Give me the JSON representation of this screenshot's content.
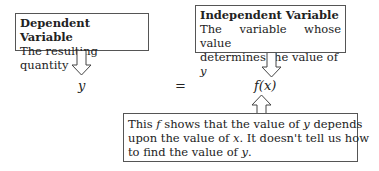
{
  "dependent": {
    "title": "Dependent Variable",
    "desc": "The resulting quantity"
  },
  "independent": {
    "title": "Independent Variable",
    "desc_1": "The variable whose value",
    "desc_2": "determines the value of ",
    "desc_2_var": "y"
  },
  "equation": {
    "lhs": "y",
    "eq": "=",
    "rhs": "f(x)"
  },
  "note": {
    "l1a": "This ",
    "l1f": "f",
    "l1b": " shows that the value of ",
    "l1y": "y",
    "l1c": " depends",
    "l2a": "upon the value of ",
    "l2x": "x",
    "l2b": ". It doesn't tell us how",
    "l3a": "to find the value of ",
    "l3y": "y",
    "l3b": "."
  }
}
